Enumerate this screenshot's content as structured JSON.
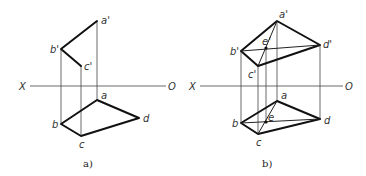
{
  "figure": {
    "panels": [
      {
        "id": "a",
        "caption": "a)",
        "axis": {
          "left_label": "X",
          "right_label": "O"
        },
        "labels": {
          "a_prime": "a'",
          "b_prime": "b'",
          "c_prime": "c'",
          "a": "a",
          "b": "b",
          "c": "c",
          "d": "d"
        }
      },
      {
        "id": "b",
        "caption": "b)",
        "axis": {
          "left_label": "X",
          "right_label": "O"
        },
        "labels": {
          "a_prime": "a'",
          "b_prime": "b'",
          "c_prime": "c'",
          "d_prime": "d'",
          "e_prime": "e'",
          "a": "a",
          "b": "b",
          "c": "c",
          "d": "d",
          "e": "e"
        }
      }
    ]
  }
}
